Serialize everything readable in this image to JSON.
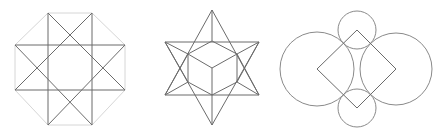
{
  "figures": [
    {
      "name": "octagram",
      "outline": [
        [
          48,
          13
        ],
        [
          92,
          13
        ],
        [
          125,
          45
        ],
        [
          125,
          90
        ],
        [
          92,
          125
        ],
        [
          48,
          125
        ],
        [
          15,
          90
        ],
        [
          15,
          45
        ]
      ],
      "lines": [
        [
          [
            48,
            13
          ],
          [
            48,
            125
          ]
        ],
        [
          [
            92,
            13
          ],
          [
            92,
            125
          ]
        ],
        [
          [
            15,
            45
          ],
          [
            125,
            45
          ]
        ],
        [
          [
            15,
            90
          ],
          [
            125,
            90
          ]
        ],
        [
          [
            48,
            13
          ],
          [
            125,
            90
          ]
        ],
        [
          [
            92,
            13
          ],
          [
            15,
            90
          ]
        ],
        [
          [
            15,
            45
          ],
          [
            92,
            125
          ]
        ],
        [
          [
            125,
            45
          ],
          [
            48,
            125
          ]
        ]
      ]
    },
    {
      "name": "stellated-hexagram-cube",
      "lines": [
        [
          [
            212,
            10
          ],
          [
            165,
            95
          ]
        ],
        [
          [
            165,
            95
          ],
          [
            259,
            95
          ]
        ],
        [
          [
            259,
            95
          ],
          [
            212,
            10
          ]
        ],
        [
          [
            212,
            125
          ],
          [
            165,
            42
          ]
        ],
        [
          [
            165,
            42
          ],
          [
            259,
            42
          ]
        ],
        [
          [
            259,
            42
          ],
          [
            212,
            125
          ]
        ],
        [
          [
            212,
            41
          ],
          [
            237,
            54
          ]
        ],
        [
          [
            237,
            54
          ],
          [
            237,
            82
          ]
        ],
        [
          [
            237,
            82
          ],
          [
            212,
            95
          ]
        ],
        [
          [
            212,
            95
          ],
          [
            188,
            82
          ]
        ],
        [
          [
            188,
            82
          ],
          [
            188,
            54
          ]
        ],
        [
          [
            188,
            54
          ],
          [
            212,
            41
          ]
        ],
        [
          [
            212,
            68
          ],
          [
            188,
            54
          ]
        ],
        [
          [
            212,
            68
          ],
          [
            237,
            54
          ]
        ],
        [
          [
            212,
            68
          ],
          [
            212,
            95
          ]
        ],
        [
          [
            212,
            10
          ],
          [
            212,
            41
          ]
        ],
        [
          [
            212,
            95
          ],
          [
            212,
            125
          ]
        ],
        [
          [
            165,
            42
          ],
          [
            188,
            54
          ]
        ],
        [
          [
            259,
            42
          ],
          [
            237,
            54
          ]
        ],
        [
          [
            165,
            95
          ],
          [
            188,
            82
          ]
        ],
        [
          [
            259,
            95
          ],
          [
            237,
            82
          ]
        ],
        [
          [
            165,
            42
          ],
          [
            188,
            82
          ]
        ],
        [
          [
            259,
            42
          ],
          [
            237,
            82
          ]
        ],
        [
          [
            165,
            95
          ],
          [
            188,
            54
          ]
        ],
        [
          [
            259,
            95
          ],
          [
            237,
            54
          ]
        ]
      ]
    },
    {
      "name": "circles-and-diamond",
      "circles": [
        {
          "cx": 357,
          "cy": 30,
          "r": 19
        },
        {
          "cx": 357,
          "cy": 108,
          "r": 19
        },
        {
          "cx": 317,
          "cy": 69,
          "r": 37
        },
        {
          "cx": 396,
          "cy": 69,
          "r": 36
        }
      ],
      "diamond": [
        [
          357,
          30
        ],
        [
          396,
          69
        ],
        [
          357,
          108
        ],
        [
          317,
          69
        ]
      ]
    }
  ]
}
